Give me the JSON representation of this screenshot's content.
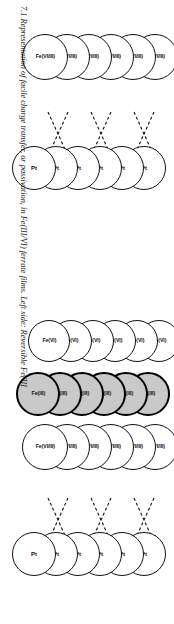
{
  "figure": {
    "caption": "7.1 Representation of facile charge transfer, or passivation, in Fe(III/VI) ferrate films. Left side: Reversible Fe(III",
    "caption_number": "7.1",
    "ink_color": "#111111",
    "shaded_fill": "#c9c9c9",
    "background": "#ffffff"
  },
  "diagrams": [
    {
      "id": "passivation",
      "name": "passivation-diagram",
      "columns": [
        {
          "id": "fe-vi-iii-passivation",
          "label": "Fe(VI/III)",
          "style": "white",
          "count": 6,
          "circles": [
            {
              "label": "Fe(VI/III)"
            },
            {
              "label": "Fe(VI/III)"
            },
            {
              "label": "Fe(VI/III)"
            },
            {
              "label": "Fe(VI/III)"
            },
            {
              "label": "Fe(VI/III)"
            },
            {
              "label": "Fe(VI/III)"
            }
          ]
        },
        {
          "id": "pt-passivation",
          "label": "Pt",
          "style": "white",
          "count": 6,
          "circles": [
            {
              "label": "Pt"
            },
            {
              "label": "Pt"
            },
            {
              "label": "Pt"
            },
            {
              "label": "Pt"
            },
            {
              "label": "Pt"
            },
            {
              "label": "Pt"
            }
          ]
        }
      ],
      "arrow_count": 6,
      "arrow_style": "dashed"
    },
    {
      "id": "reversible",
      "name": "reversible-charge-transfer-diagram",
      "columns": [
        {
          "id": "fe-vi",
          "label": "Fe(VI)",
          "style": "white",
          "count": 6,
          "circles": [
            {
              "label": "Fe(VI)"
            },
            {
              "label": "Fe(VI)"
            },
            {
              "label": "Fe(VI)"
            },
            {
              "label": "Fe(VI)"
            },
            {
              "label": "Fe(VI)"
            },
            {
              "label": "Fe(VI)"
            }
          ]
        },
        {
          "id": "fe-iii",
          "label": "Fe(III)",
          "style": "shaded",
          "count": 6,
          "circles": [
            {
              "label": "Fe(III)"
            },
            {
              "label": "Fe(III)"
            },
            {
              "label": "Fe(III)"
            },
            {
              "label": "Fe(III)"
            },
            {
              "label": "Fe(III)"
            },
            {
              "label": "Fe(III)"
            }
          ]
        },
        {
          "id": "fe-vi-iii-reversible",
          "label": "Fe(VI/III)",
          "style": "white",
          "count": 6,
          "circles": [
            {
              "label": "Fe(VI/III)"
            },
            {
              "label": "Fe(VI/III)"
            },
            {
              "label": "Fe(VI/III)"
            },
            {
              "label": "Fe(VI/III)"
            },
            {
              "label": "Fe(VI/III)"
            },
            {
              "label": "Fe(VI/III)"
            }
          ]
        },
        {
          "id": "pt-reversible",
          "label": "Pt",
          "style": "white",
          "count": 6,
          "circles": [
            {
              "label": "Pt"
            },
            {
              "label": "Pt"
            },
            {
              "label": "Pt"
            },
            {
              "label": "Pt"
            },
            {
              "label": "Pt"
            },
            {
              "label": "Pt"
            }
          ]
        }
      ],
      "arrow_count": 6,
      "arrow_style": "dashed"
    }
  ]
}
